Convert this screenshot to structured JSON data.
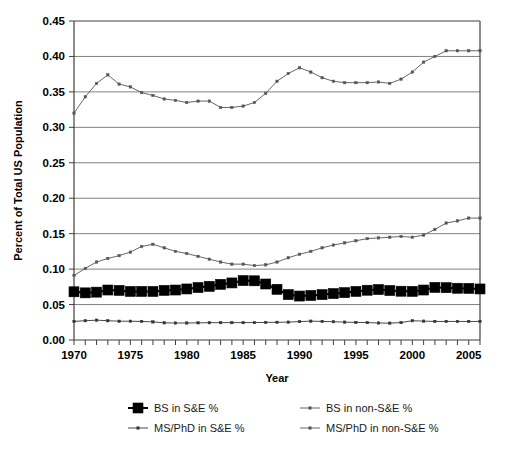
{
  "chart_data": {
    "type": "line",
    "title": "",
    "xlabel": "Year",
    "ylabel": "Percent of Total US Population",
    "xlim": [
      1970,
      2006
    ],
    "ylim": [
      0.0,
      0.45
    ],
    "ytick_step": 0.05,
    "xtick_step": 1,
    "xtick_label_step": 5,
    "grid": "horizontal",
    "legend_position": "bottom",
    "x": [
      1970,
      1971,
      1972,
      1973,
      1974,
      1975,
      1976,
      1977,
      1978,
      1979,
      1980,
      1981,
      1982,
      1983,
      1984,
      1985,
      1986,
      1987,
      1988,
      1989,
      1990,
      1991,
      1992,
      1993,
      1994,
      1995,
      1996,
      1997,
      1998,
      1999,
      2000,
      2001,
      2002,
      2003,
      2004,
      2005,
      2006
    ],
    "ytick_labels": [
      "0.00",
      "0.05",
      "0.10",
      "0.15",
      "0.20",
      "0.25",
      "0.30",
      "0.35",
      "0.40",
      "0.45"
    ],
    "xtick_labels": [
      "1970",
      "1975",
      "1980",
      "1985",
      "1990",
      "1995",
      "2000",
      "2005"
    ],
    "series": [
      {
        "name": "BS in S&E %",
        "marker": "filled-square",
        "marker_size": 5,
        "line_width": 2,
        "color": "#000000",
        "values": [
          0.068,
          0.0665,
          0.0675,
          0.0705,
          0.07,
          0.0685,
          0.0685,
          0.0685,
          0.07,
          0.0705,
          0.072,
          0.074,
          0.0757,
          0.0785,
          0.0805,
          0.0838,
          0.0835,
          0.079,
          0.0715,
          0.064,
          0.062,
          0.0628,
          0.064,
          0.0655,
          0.0668,
          0.0685,
          0.0702,
          0.0712,
          0.0698,
          0.0688,
          0.0686,
          0.0705,
          0.0742,
          0.0738,
          0.073,
          0.0728,
          0.072
        ]
      },
      {
        "name": "BS in non-S&E %",
        "marker": "small-dot",
        "marker_size": 2.4,
        "line_width": 0.9,
        "color": "#555555",
        "values": [
          0.32,
          0.343,
          0.362,
          0.374,
          0.361,
          0.357,
          0.349,
          0.345,
          0.34,
          0.338,
          0.335,
          0.337,
          0.337,
          0.328,
          0.328,
          0.33,
          0.335,
          0.348,
          0.365,
          0.376,
          0.384,
          0.378,
          0.37,
          0.365,
          0.363,
          0.363,
          0.363,
          0.364,
          0.362,
          0.368,
          0.378,
          0.392,
          0.4,
          0.408,
          0.408,
          0.408,
          0.408
        ]
      },
      {
        "name": "MS/PhD in S&E %",
        "marker": "small-dot",
        "marker_size": 2.4,
        "line_width": 0.9,
        "color": "#333333",
        "values": [
          0.0262,
          0.0272,
          0.028,
          0.0272,
          0.0265,
          0.0265,
          0.0262,
          0.0255,
          0.0242,
          0.024,
          0.024,
          0.0242,
          0.0244,
          0.0245,
          0.0245,
          0.0245,
          0.0246,
          0.0248,
          0.025,
          0.0252,
          0.026,
          0.0266,
          0.0262,
          0.0258,
          0.0252,
          0.0248,
          0.0246,
          0.024,
          0.0238,
          0.0246,
          0.0272,
          0.0266,
          0.0262,
          0.0262,
          0.0262,
          0.0262,
          0.0262
        ]
      },
      {
        "name": "MS/PhD in non-S&E %",
        "marker": "small-dot",
        "marker_size": 2.4,
        "line_width": 0.9,
        "color": "#555555",
        "values": [
          0.091,
          0.101,
          0.11,
          0.115,
          0.119,
          0.124,
          0.132,
          0.135,
          0.13,
          0.125,
          0.122,
          0.118,
          0.114,
          0.11,
          0.107,
          0.107,
          0.105,
          0.106,
          0.11,
          0.116,
          0.121,
          0.125,
          0.13,
          0.134,
          0.137,
          0.14,
          0.143,
          0.144,
          0.145,
          0.146,
          0.145,
          0.148,
          0.156,
          0.165,
          0.168,
          0.172,
          0.172
        ]
      }
    ]
  },
  "legend": {
    "entries": [
      {
        "label": "BS in S&E %",
        "marker": "filled-square"
      },
      {
        "label": "BS in non-S&E %",
        "marker": "small-dot"
      },
      {
        "label": "MS/PhD in S&E %",
        "marker": "small-dot"
      },
      {
        "label": "MS/PhD in non-S&E %",
        "marker": "small-dot"
      }
    ]
  },
  "colors": {
    "grid": "#808080",
    "axis": "#404040",
    "background": "#ffffff",
    "text": "#000000"
  }
}
